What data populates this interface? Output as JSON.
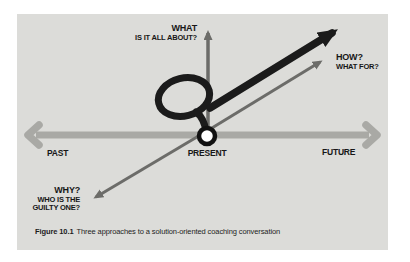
{
  "figure": {
    "caption_label": "Figure 10.1",
    "caption_text": "Three approaches to a solution-oriented coaching conversation"
  },
  "diagram": {
    "timeline": {
      "past": "PAST",
      "present": "PRESENT",
      "future": "FUTURE"
    },
    "labels": {
      "what": {
        "title": "WHAT",
        "subtitle": "IS IT ALL ABOUT?"
      },
      "how": {
        "title": "HOW?",
        "subtitle": "WHAT FOR?"
      },
      "why": {
        "title": "WHY?",
        "subtitle_line1": "WHO IS THE",
        "subtitle_line2": "GUILTY ONE?"
      }
    },
    "icons": {
      "timeline_arrow": "double-headed-horizontal-arrow",
      "what_axis_arrow": "vertical-up-arrow",
      "why_how_arrow": "thin-diagonal-double-arrow",
      "solution_loop_arrow": "thick-looping-arrow",
      "present_marker": "white-dot"
    },
    "colors": {
      "panel_background": "#dcdcd9",
      "timeline": "#a9a9a5",
      "thin_arrow": "#6c6c69",
      "thick_arrow": "#1b1b1b",
      "present_dot_fill": "#ffffff"
    }
  }
}
